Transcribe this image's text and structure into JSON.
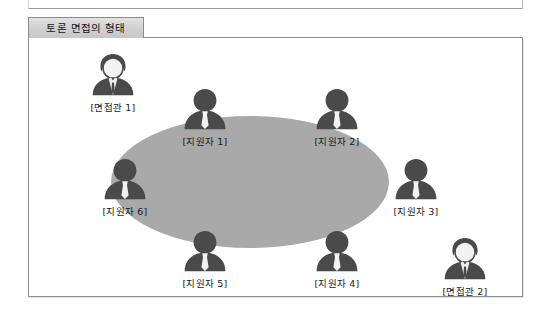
{
  "figure": {
    "title": "토론 면접의 형태",
    "table_shape": "ellipse",
    "colors": {
      "table_fill": "#a9a9a9",
      "figure_dark": "#4a4a4a",
      "figure_light": "#f2f2f2",
      "frame_border": "#8e8e8e",
      "tab_fill": "#d2d2d2",
      "page_background": "#ffffff"
    },
    "people": [
      {
        "id": "interviewer-1",
        "label": "[면접관 1]",
        "role": "interviewer",
        "icon": "person-interviewer-icon",
        "x": 52,
        "y": 14
      },
      {
        "id": "applicant-1",
        "label": "[지원자 1]",
        "role": "applicant",
        "icon": "person-applicant-icon",
        "x": 144,
        "y": 48
      },
      {
        "id": "applicant-2",
        "label": "[지원자 2]",
        "role": "applicant",
        "icon": "person-applicant-icon",
        "x": 276,
        "y": 48
      },
      {
        "id": "applicant-3",
        "label": "[지원자 3]",
        "role": "applicant",
        "icon": "person-applicant-icon",
        "x": 355,
        "y": 118
      },
      {
        "id": "applicant-4",
        "label": "[지원자 4]",
        "role": "applicant",
        "icon": "person-applicant-icon",
        "x": 276,
        "y": 190
      },
      {
        "id": "applicant-5",
        "label": "[지원자 5]",
        "role": "applicant",
        "icon": "person-applicant-icon",
        "x": 144,
        "y": 190
      },
      {
        "id": "applicant-6",
        "label": "[지원자 6]",
        "role": "applicant",
        "icon": "person-applicant-icon",
        "x": 64,
        "y": 118
      },
      {
        "id": "interviewer-2",
        "label": "[면접관 2]",
        "role": "interviewer",
        "icon": "person-interviewer-icon",
        "x": 404,
        "y": 198
      }
    ]
  }
}
